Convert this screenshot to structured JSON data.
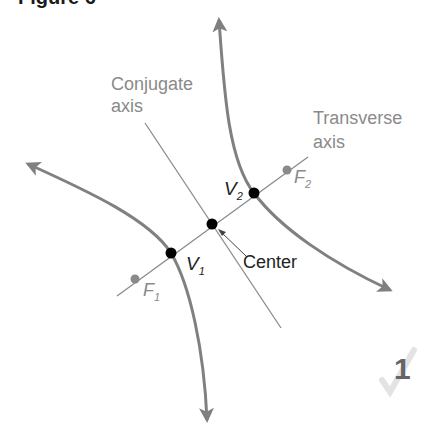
{
  "figure": {
    "title": "Figure 6",
    "labels": {
      "conjugate_axis_line1": "Conjugate",
      "conjugate_axis_line2": "axis",
      "transverse_axis_line1": "Transverse",
      "transverse_axis_line2": "axis",
      "center": "Center",
      "vertex1": "V",
      "vertex1_sub": "1",
      "vertex2": "V",
      "vertex2_sub": "2",
      "focus1": "F",
      "focus1_sub": "1",
      "focus2": "F",
      "focus2_sub": "2"
    },
    "page_marker": "1",
    "colors": {
      "curve": "#808080",
      "axis_line": "#8a8a8a",
      "vertex_dot": "#000000",
      "focus_dot": "#8a8a8a",
      "label_text": "#8a8a8a",
      "page_marker": "#666666"
    }
  }
}
